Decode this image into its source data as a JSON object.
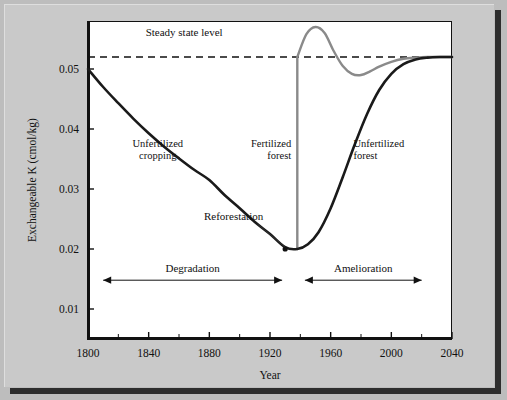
{
  "chart_data": {
    "type": "line",
    "title": "",
    "xlabel": "Year",
    "ylabel": "Exchangeable K (cmol/kg)",
    "xlim": [
      1800,
      2040
    ],
    "ylim": [
      0.005,
      0.058
    ],
    "grid": false,
    "legend_position": "in-plot-labels",
    "x_ticks": [
      1800,
      1840,
      1880,
      1920,
      1960,
      2000,
      2040
    ],
    "x_tick_labels": [
      "1800",
      "1840",
      "1880",
      "1920",
      "1960",
      "2000",
      "2040"
    ],
    "x_minor_ticks": [
      1820,
      1860,
      1900,
      1940,
      1980,
      2020
    ],
    "y_ticks": [
      0.01,
      0.02,
      0.03,
      0.04,
      0.05
    ],
    "y_tick_labels": [
      "0.01",
      "0.02",
      "0.03",
      "0.04",
      "0.05"
    ],
    "steady_state_level": 0.052,
    "series": [
      {
        "name": "Unfertilized cropping then unfertilized forest",
        "color": "#1a1a1a",
        "style": "solid",
        "x": [
          1800,
          1810,
          1820,
          1830,
          1840,
          1850,
          1860,
          1870,
          1880,
          1890,
          1900,
          1910,
          1920,
          1930,
          1938,
          1945,
          1952,
          1960,
          1968,
          1976,
          1984,
          1992,
          2000,
          2008,
          2016,
          2024,
          2032,
          2040
        ],
        "y": [
          0.05,
          0.047,
          0.0443,
          0.0417,
          0.0393,
          0.0371,
          0.0351,
          0.0332,
          0.0315,
          0.029,
          0.0268,
          0.0245,
          0.0225,
          0.0203,
          0.02,
          0.0208,
          0.0228,
          0.0268,
          0.032,
          0.0375,
          0.0425,
          0.0465,
          0.0492,
          0.0508,
          0.0516,
          0.0519,
          0.052,
          0.052
        ]
      },
      {
        "name": "Fertilized forest",
        "color": "#8a8a8a",
        "style": "solid",
        "x": [
          1938,
          1938,
          1944,
          1950,
          1956,
          1962,
          1968,
          1974,
          1980,
          1986,
          1992,
          2000,
          2008,
          2016,
          2024,
          2032,
          2040
        ],
        "y": [
          0.02,
          0.052,
          0.0558,
          0.057,
          0.056,
          0.053,
          0.0505,
          0.0492,
          0.049,
          0.0496,
          0.0504,
          0.0512,
          0.0517,
          0.0519,
          0.052,
          0.052,
          0.052
        ]
      }
    ],
    "annotations": [
      {
        "name": "steady-state-label",
        "text": "Steady state level",
        "x": 1838,
        "y": 0.0555
      },
      {
        "name": "unfertilized-cropping-label",
        "line1": "Unfertilized",
        "line2": "cropping",
        "x": 1846,
        "y": 0.037
      },
      {
        "name": "fertilized-forest-label",
        "line1": "Fertilized",
        "line2": "forest",
        "x": 1934,
        "y": 0.037
      },
      {
        "name": "unfertilized-forest-label",
        "line1": "Unfertilized",
        "line2": "forest",
        "x": 1975,
        "y": 0.037
      },
      {
        "name": "reforestation-label",
        "text": "Reforestation",
        "x": 1896,
        "y": 0.0248
      }
    ],
    "range_markers": [
      {
        "name": "degradation-arrow",
        "label": "Degradation",
        "x_start": 1810,
        "x_end": 1928
      },
      {
        "name": "amelioration-arrow",
        "label": "Amelioration",
        "x_start": 1943,
        "x_end": 2020
      }
    ],
    "reforestation_point": {
      "x": 1930,
      "y": 0.02
    }
  }
}
